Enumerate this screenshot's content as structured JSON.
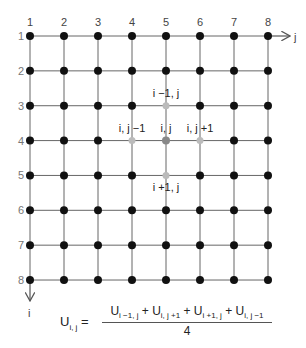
{
  "diagram": {
    "grid": {
      "rows": 8,
      "cols": 8,
      "origin_x": 30,
      "origin_y": 36,
      "dx": 34.0,
      "dy": 34.86,
      "line_color": "#666666",
      "node_color": "#111111",
      "node_radius": 4
    },
    "column_labels": [
      "1",
      "2",
      "3",
      "4",
      "5",
      "6",
      "7",
      "8"
    ],
    "row_labels": [
      "1",
      "2",
      "3",
      "4",
      "5",
      "6",
      "7",
      "8"
    ],
    "axes": {
      "j_label": "j",
      "i_label": "i"
    },
    "stencil": {
      "center": {
        "row": 4,
        "col": 5,
        "label": "i, j",
        "color": "#888888"
      },
      "neighbors": [
        {
          "row": 3,
          "col": 5,
          "label": "i −1, j",
          "position": "above",
          "color": "#bbbbbb"
        },
        {
          "row": 4,
          "col": 4,
          "label": "i, j −1",
          "position": "above",
          "color": "#bbbbbb"
        },
        {
          "row": 4,
          "col": 6,
          "label": "i, j +1",
          "position": "above",
          "color": "#bbbbbb"
        },
        {
          "row": 5,
          "col": 5,
          "label": "i +1, j",
          "position": "below",
          "color": "#bbbbbb"
        }
      ]
    },
    "formula": {
      "lhs": "U",
      "lhs_sub": "i, j",
      "equals": "=",
      "numerator_terms": [
        {
          "base": "U",
          "sub": "i −1, j"
        },
        {
          "base": "U",
          "sub": "i, j +1"
        },
        {
          "base": "U",
          "sub": "i +1, j"
        },
        {
          "base": "U",
          "sub": "i, j −1"
        }
      ],
      "plus": "+",
      "denominator": "4"
    }
  }
}
